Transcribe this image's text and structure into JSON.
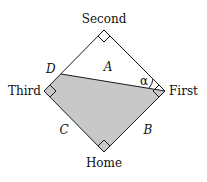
{
  "diagram": {
    "bases": {
      "second": "Second",
      "first": "First",
      "home": "Home",
      "third": "Third"
    },
    "point_labels": {
      "d": "D"
    },
    "region_labels": {
      "a": "A",
      "b": "B",
      "c": "C"
    },
    "angle_label": "α",
    "colors": {
      "shaded_region": "#c8c8c8",
      "stroke": "#1a1a1a",
      "background": "#ffffff"
    }
  }
}
